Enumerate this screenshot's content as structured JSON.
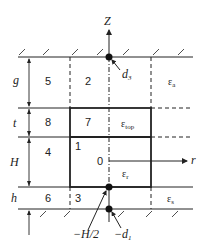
{
  "diagram": {
    "axes": {
      "z_label": "Z",
      "r_label": "r",
      "origin_label": "0"
    },
    "regions": [
      {
        "id": "1",
        "label": "1"
      },
      {
        "id": "2",
        "label": "2"
      },
      {
        "id": "3",
        "label": "3"
      },
      {
        "id": "4",
        "label": "4"
      },
      {
        "id": "5",
        "label": "5"
      },
      {
        "id": "6",
        "label": "6"
      },
      {
        "id": "7",
        "label": "7"
      },
      {
        "id": "8",
        "label": "8"
      }
    ],
    "dimensions": {
      "g": "g",
      "t": "t",
      "H": "H",
      "h": "h"
    },
    "permittivities": {
      "eps_a": {
        "main": "ε",
        "sub": "a"
      },
      "eps_top": {
        "main": "ε",
        "sub": "top"
      },
      "eps_r": {
        "main": "ε",
        "sub": "r"
      },
      "eps_s": {
        "main": "ε",
        "sub": "s"
      }
    },
    "points": {
      "d3": {
        "main": "d",
        "sub": "3"
      },
      "minus_h2": "−H/2",
      "minus_d1": {
        "main": "−d",
        "sub": "1"
      }
    },
    "colors": {
      "line": "#222222",
      "background": "#ffffff"
    }
  }
}
